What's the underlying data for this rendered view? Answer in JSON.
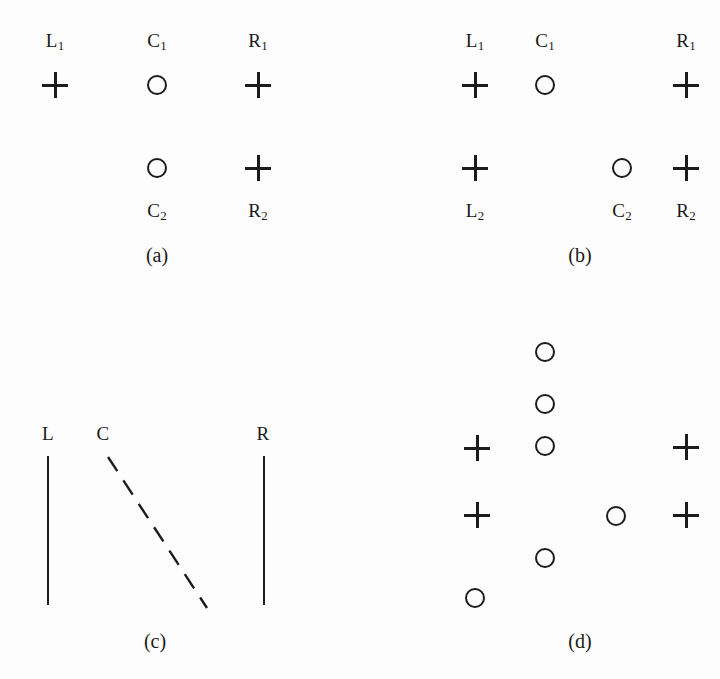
{
  "figure": {
    "background_color": "#fdfdfd",
    "ink_color": "#1c1c1c",
    "width": 720,
    "height": 679,
    "panels": [
      {
        "id": "a",
        "caption": "(a)",
        "caption_x": 157,
        "caption_y": 255,
        "labels": [
          {
            "name": "label-l1",
            "base": "L",
            "sub": "1",
            "x": 55,
            "y": 42
          },
          {
            "name": "label-c1",
            "base": "C",
            "sub": "1",
            "x": 157,
            "y": 42
          },
          {
            "name": "label-r1",
            "base": "R",
            "sub": "1",
            "x": 258,
            "y": 42
          },
          {
            "name": "label-c2",
            "base": "C",
            "sub": "2",
            "x": 157,
            "y": 212
          },
          {
            "name": "label-r2",
            "base": "R",
            "sub": "2",
            "x": 258,
            "y": 212
          }
        ],
        "marks": [
          {
            "name": "plus-l1",
            "glyph": "plus",
            "x": 55,
            "y": 85
          },
          {
            "name": "circle-c1",
            "glyph": "circle",
            "x": 157,
            "y": 85
          },
          {
            "name": "plus-r1",
            "glyph": "plus",
            "x": 258,
            "y": 85
          },
          {
            "name": "circle-c2",
            "glyph": "circle",
            "x": 157,
            "y": 168
          },
          {
            "name": "plus-r2",
            "glyph": "plus",
            "x": 258,
            "y": 168
          }
        ],
        "rules": [],
        "dashed_lines": []
      },
      {
        "id": "b",
        "caption": "(b)",
        "caption_x": 580,
        "caption_y": 255,
        "labels": [
          {
            "name": "label-l1",
            "base": "L",
            "sub": "1",
            "x": 475,
            "y": 42
          },
          {
            "name": "label-c1",
            "base": "C",
            "sub": "1",
            "x": 545,
            "y": 42
          },
          {
            "name": "label-r1",
            "base": "R",
            "sub": "1",
            "x": 686,
            "y": 42
          },
          {
            "name": "label-l2",
            "base": "L",
            "sub": "2",
            "x": 475,
            "y": 212
          },
          {
            "name": "label-c2",
            "base": "C",
            "sub": "2",
            "x": 622,
            "y": 212
          },
          {
            "name": "label-r2",
            "base": "R",
            "sub": "2",
            "x": 686,
            "y": 212
          }
        ],
        "marks": [
          {
            "name": "plus-l1",
            "glyph": "plus",
            "x": 475,
            "y": 85
          },
          {
            "name": "circle-c1",
            "glyph": "circle",
            "x": 545,
            "y": 85
          },
          {
            "name": "plus-r1",
            "glyph": "plus",
            "x": 686,
            "y": 85
          },
          {
            "name": "plus-l2",
            "glyph": "plus",
            "x": 475,
            "y": 168
          },
          {
            "name": "circle-c2",
            "glyph": "circle",
            "x": 622,
            "y": 168
          },
          {
            "name": "plus-r2",
            "glyph": "plus",
            "x": 686,
            "y": 168
          }
        ],
        "rules": [],
        "dashed_lines": []
      },
      {
        "id": "c",
        "caption": "(c)",
        "caption_x": 155,
        "caption_y": 641,
        "labels": [
          {
            "name": "label-l",
            "base": "L",
            "sub": "",
            "x": 48,
            "y": 433
          },
          {
            "name": "label-c",
            "base": "C",
            "sub": "",
            "x": 103,
            "y": 433
          },
          {
            "name": "label-r",
            "base": "R",
            "sub": "",
            "x": 263,
            "y": 433
          }
        ],
        "marks": [],
        "rules": [
          {
            "name": "rule-l",
            "x": 48,
            "y1": 456,
            "y2": 605
          },
          {
            "name": "rule-r",
            "x": 264,
            "y1": 456,
            "y2": 605
          }
        ],
        "dashed_lines": [
          {
            "name": "dashed-rule-c",
            "x1": 108,
            "y1": 457,
            "x2": 207,
            "y2": 608
          }
        ]
      },
      {
        "id": "d",
        "caption": "(d)",
        "caption_x": 580,
        "caption_y": 641,
        "labels": [],
        "marks": [
          {
            "name": "circle-c-1",
            "glyph": "circle",
            "x": 545,
            "y": 352
          },
          {
            "name": "circle-c-2",
            "glyph": "circle",
            "x": 545,
            "y": 404
          },
          {
            "name": "plus-left-1",
            "glyph": "plus",
            "x": 477,
            "y": 448
          },
          {
            "name": "circle-c-3",
            "glyph": "circle",
            "x": 545,
            "y": 446
          },
          {
            "name": "plus-right-1",
            "glyph": "plus",
            "x": 686,
            "y": 447
          },
          {
            "name": "plus-left-2",
            "glyph": "plus",
            "x": 477,
            "y": 515
          },
          {
            "name": "circle-mid",
            "glyph": "circle",
            "x": 616,
            "y": 516
          },
          {
            "name": "plus-right-2",
            "glyph": "plus",
            "x": 686,
            "y": 515
          },
          {
            "name": "circle-c-4",
            "glyph": "circle",
            "x": 545,
            "y": 558
          },
          {
            "name": "circle-left",
            "glyph": "circle",
            "x": 475,
            "y": 598
          }
        ],
        "rules": [],
        "dashed_lines": []
      }
    ]
  }
}
